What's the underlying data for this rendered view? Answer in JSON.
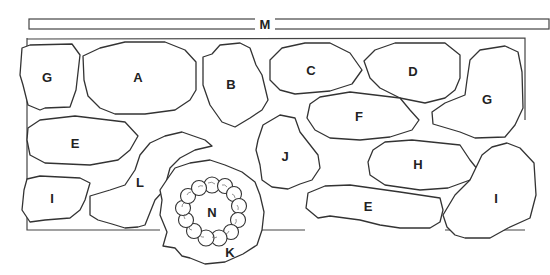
{
  "diagram": {
    "colors": {
      "stroke": "#333333",
      "background": "#ffffff"
    },
    "bar": {
      "label": "M"
    },
    "regions": [
      {
        "id": "G-top-left",
        "label": "G"
      },
      {
        "id": "A",
        "label": "A"
      },
      {
        "id": "B",
        "label": "B"
      },
      {
        "id": "C",
        "label": "C"
      },
      {
        "id": "D",
        "label": "D"
      },
      {
        "id": "G-right",
        "label": "G"
      },
      {
        "id": "E-left",
        "label": "E"
      },
      {
        "id": "F",
        "label": "F"
      },
      {
        "id": "J",
        "label": "J"
      },
      {
        "id": "H",
        "label": "H"
      },
      {
        "id": "I-left",
        "label": "I"
      },
      {
        "id": "L",
        "label": "L"
      },
      {
        "id": "E-bottom",
        "label": "E"
      },
      {
        "id": "I-right",
        "label": "I"
      },
      {
        "id": "K",
        "label": "K"
      },
      {
        "id": "N",
        "label": "N"
      }
    ]
  }
}
